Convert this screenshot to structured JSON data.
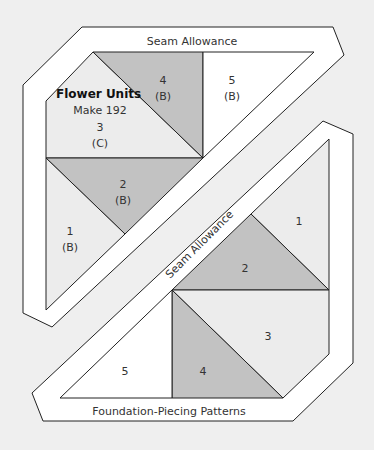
{
  "colors": {
    "background": "#efefef",
    "seam": "#ffffff",
    "dark": "#c2c2c2",
    "light": "#ececec",
    "white": "#ffffff",
    "line": "#222222"
  },
  "top_pattern": {
    "seam_label": "Seam Allowance",
    "title": "Flower Units",
    "subtitle": "Make 192",
    "pieces": [
      {
        "num": "1",
        "fabric": "(B)"
      },
      {
        "num": "2",
        "fabric": "(B)"
      },
      {
        "num": "3",
        "fabric": "(C)"
      },
      {
        "num": "4",
        "fabric": "(B)"
      },
      {
        "num": "5",
        "fabric": "(B)"
      }
    ]
  },
  "bottom_pattern": {
    "seam_label": "Seam Allowance",
    "footer_label": "Foundation-Piecing Patterns",
    "pieces": [
      {
        "num": "1"
      },
      {
        "num": "2"
      },
      {
        "num": "3"
      },
      {
        "num": "4"
      },
      {
        "num": "5"
      }
    ]
  }
}
